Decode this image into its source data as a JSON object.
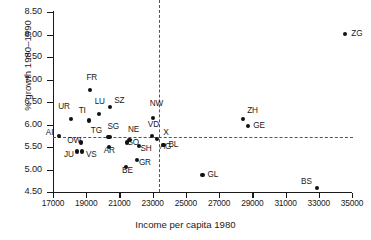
{
  "chart_data": {
    "type": "scatter",
    "title": "",
    "xlabel": "Income per capita 1980",
    "ylabel": "% growth 1980–1990",
    "xlim": [
      17000,
      35000
    ],
    "ylim": [
      4.5,
      8.5
    ],
    "xticks": [
      17000,
      19000,
      21000,
      23000,
      25000,
      27000,
      29000,
      31000,
      33000,
      35000
    ],
    "xtick_labels": [
      "17000",
      "19000",
      "21000",
      "23000",
      "25000",
      "27000",
      "29000",
      "31000",
      "33000",
      "35000"
    ],
    "yticks": [
      4.5,
      5.0,
      5.5,
      6.0,
      6.5,
      7.0,
      7.5,
      8.0,
      8.5
    ],
    "ytick_labels": [
      "4.50",
      "5.00",
      "5.50",
      "6.00",
      "6.50",
      "7.00",
      "7.50",
      "8.00",
      "8.50"
    ],
    "grid": false,
    "legend": "none",
    "reference_lines": {
      "horizontal_y": 5.72,
      "vertical_x": 23400,
      "style": "dashed",
      "marker_label": "X"
    },
    "points": [
      {
        "label": "AI",
        "x": 17350,
        "y": 5.74,
        "lx": -13,
        "ly": -3
      },
      {
        "label": "UR",
        "x": 18100,
        "y": 6.12,
        "lx": -13,
        "ly": -12
      },
      {
        "label": "JU",
        "x": 18450,
        "y": 5.4,
        "lx": -13,
        "ly": 3
      },
      {
        "label": "OW",
        "x": 18700,
        "y": 5.6,
        "lx": -14,
        "ly": -2
      },
      {
        "label": "VS",
        "x": 18750,
        "y": 5.4,
        "lx": 4,
        "ly": 3
      },
      {
        "label": "TI",
        "x": 19150,
        "y": 6.09,
        "lx": -10,
        "ly": -9
      },
      {
        "label": "FR",
        "x": 19250,
        "y": 6.76,
        "lx": -4,
        "ly": -12
      },
      {
        "label": "LU",
        "x": 19750,
        "y": 6.23,
        "lx": -4,
        "ly": -12
      },
      {
        "label": "TG",
        "x": 20300,
        "y": 5.72,
        "lx": -17,
        "ly": -6
      },
      {
        "label": "AR",
        "x": 20350,
        "y": 5.5,
        "lx": -5,
        "ly": 4
      },
      {
        "label": "SG",
        "x": 20400,
        "y": 5.73,
        "lx": -2,
        "ly": -10
      },
      {
        "label": "SZ",
        "x": 20450,
        "y": 6.38,
        "lx": 4,
        "ly": -6
      },
      {
        "label": "BE",
        "x": 21400,
        "y": 5.05,
        "lx": -4,
        "ly": 4
      },
      {
        "label": "NE",
        "x": 21450,
        "y": 5.6,
        "lx": 1,
        "ly": -13
      },
      {
        "label": "SO",
        "x": 21600,
        "y": 5.65,
        "lx": -2,
        "ly": 3
      },
      {
        "label": "GR",
        "x": 22050,
        "y": 5.21,
        "lx": 2,
        "ly": 3
      },
      {
        "label": "SH",
        "x": 22200,
        "y": 5.53,
        "lx": 1,
        "ly": 3
      },
      {
        "label": "VD",
        "x": 22950,
        "y": 5.75,
        "lx": -4,
        "ly": -11
      },
      {
        "label": "NW",
        "x": 23000,
        "y": 6.14,
        "lx": -3,
        "ly": -14
      },
      {
        "label": "AG",
        "x": 23250,
        "y": 5.67,
        "lx": 3,
        "ly": 8
      },
      {
        "label": "BL",
        "x": 23650,
        "y": 5.54,
        "lx": 5,
        "ly": 0
      },
      {
        "label": "GL",
        "x": 26000,
        "y": 4.88,
        "lx": 5,
        "ly": 0
      },
      {
        "label": "ZH",
        "x": 28450,
        "y": 6.12,
        "lx": 4,
        "ly": -8
      },
      {
        "label": "GE",
        "x": 28750,
        "y": 5.97,
        "lx": 5,
        "ly": 0
      },
      {
        "label": "BS",
        "x": 32900,
        "y": 4.58,
        "lx": -16,
        "ly": -6
      },
      {
        "label": "ZG",
        "x": 34600,
        "y": 8.02,
        "lx": 6,
        "ly": 0
      }
    ]
  }
}
